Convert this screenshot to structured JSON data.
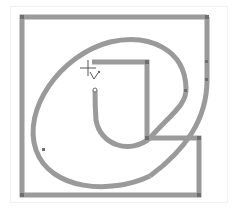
{
  "canvas": {
    "background": "#ffffff",
    "frame_color": "#f0f0f0"
  },
  "drawing": {
    "stroke_color": "#9a9a9a",
    "stroke_width": 5,
    "anchor_color": "#6e6e6e",
    "shapes": [
      "outer-frame-path",
      "inner-step-path",
      "spiral-curve-path"
    ]
  },
  "cursor": {
    "icon": "crosshair-pen-cursor-icon",
    "x": 88,
    "y": 68
  }
}
